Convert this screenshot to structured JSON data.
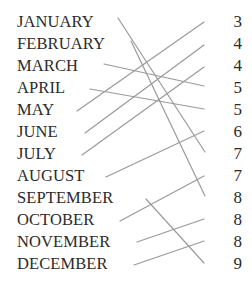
{
  "diagram": {
    "type": "matching-lines",
    "background_color": "#ffffff",
    "text_color": "#2b2b2b",
    "line_color": "#9a9a9a",
    "line_width": 1.2,
    "width": 252,
    "height": 290,
    "left_items": [
      {
        "id": "jan",
        "label": "JANUARY",
        "y": 22
      },
      {
        "id": "feb",
        "label": "FEBRUARY",
        "y": 44
      },
      {
        "id": "mar",
        "label": "MARCH",
        "y": 66
      },
      {
        "id": "apr",
        "label": "APRIL",
        "y": 88
      },
      {
        "id": "may",
        "label": "MAY",
        "y": 110
      },
      {
        "id": "jun",
        "label": "JUNE",
        "y": 132
      },
      {
        "id": "jul",
        "label": "JULY",
        "y": 154
      },
      {
        "id": "aug",
        "label": "AUGUST",
        "y": 176
      },
      {
        "id": "sep",
        "label": "SEPTEMBER",
        "y": 198
      },
      {
        "id": "oct",
        "label": "OCTOBER",
        "y": 220
      },
      {
        "id": "nov",
        "label": "NOVEMBER",
        "y": 242
      },
      {
        "id": "dec",
        "label": "DECEMBER",
        "y": 264
      }
    ],
    "right_items": [
      {
        "id": "n3",
        "label": "3",
        "y": 22
      },
      {
        "id": "n4a",
        "label": "4",
        "y": 44
      },
      {
        "id": "n4b",
        "label": "4",
        "y": 66
      },
      {
        "id": "n5a",
        "label": "5",
        "y": 88
      },
      {
        "id": "n5b",
        "label": "5",
        "y": 110
      },
      {
        "id": "n6",
        "label": "6",
        "y": 132
      },
      {
        "id": "n7a",
        "label": "7",
        "y": 154
      },
      {
        "id": "n7b",
        "label": "7",
        "y": 176
      },
      {
        "id": "n8a",
        "label": "8",
        "y": 198
      },
      {
        "id": "n8b",
        "label": "8",
        "y": 220
      },
      {
        "id": "n8c",
        "label": "8",
        "y": 242
      },
      {
        "id": "n9",
        "label": "9",
        "y": 264
      }
    ],
    "connections": [
      {
        "from": "jan",
        "from_label": "JANUARY",
        "to": "n7a",
        "to_label": "7",
        "x1": 118,
        "y1": 18,
        "x2": 205,
        "y2": 152
      },
      {
        "from": "feb",
        "from_label": "FEBRUARY",
        "to": "n8a",
        "to_label": "8",
        "x1": 131,
        "y1": 41,
        "x2": 205,
        "y2": 196
      },
      {
        "from": "mar",
        "from_label": "MARCH",
        "to": "n5a",
        "to_label": "5",
        "x1": 104,
        "y1": 64,
        "x2": 204,
        "y2": 86
      },
      {
        "from": "apr",
        "from_label": "APRIL",
        "to": "n5b",
        "to_label": "5",
        "x1": 90,
        "y1": 89,
        "x2": 204,
        "y2": 109
      },
      {
        "from": "may",
        "from_label": "MAY",
        "to": "n3",
        "to_label": "3",
        "x1": 77,
        "y1": 111,
        "x2": 204,
        "y2": 22
      },
      {
        "from": "jun",
        "from_label": "JUNE",
        "to": "n4a",
        "to_label": "4",
        "x1": 85,
        "y1": 133,
        "x2": 204,
        "y2": 45
      },
      {
        "from": "jul",
        "from_label": "JULY",
        "to": "n4b",
        "to_label": "4",
        "x1": 82,
        "y1": 155,
        "x2": 204,
        "y2": 67
      },
      {
        "from": "aug",
        "from_label": "AUGUST",
        "to": "n6",
        "to_label": "6",
        "x1": 106,
        "y1": 177,
        "x2": 204,
        "y2": 131
      },
      {
        "from": "sep",
        "from_label": "SEPTEMBER",
        "to": "n9",
        "to_label": "9",
        "x1": 146,
        "y1": 199,
        "x2": 204,
        "y2": 263
      },
      {
        "from": "oct",
        "from_label": "OCTOBER",
        "to": "n7b",
        "to_label": "7",
        "x1": 120,
        "y1": 221,
        "x2": 204,
        "y2": 176
      },
      {
        "from": "nov",
        "from_label": "NOVEMBER",
        "to": "n8b",
        "to_label": "8",
        "x1": 137,
        "y1": 242,
        "x2": 204,
        "y2": 219
      },
      {
        "from": "dec",
        "from_label": "DECEMBER",
        "to": "n8c",
        "to_label": "8",
        "x1": 134,
        "y1": 265,
        "x2": 204,
        "y2": 241
      }
    ]
  }
}
